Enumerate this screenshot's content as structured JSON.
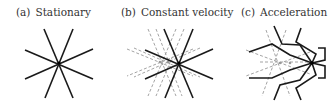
{
  "panels": [
    {
      "tag": "(a)",
      "title": "Stationary"
    },
    {
      "tag": "(b)",
      "title": "Constant velocity"
    },
    {
      "tag": "(c)",
      "title": "Acceleration"
    }
  ],
  "colors": {
    "solid": "#1a1a1a",
    "dashed": "#999999"
  }
}
